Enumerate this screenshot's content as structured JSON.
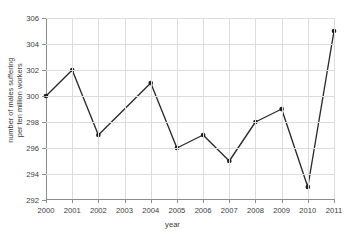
{
  "chart_data": {
    "type": "line",
    "title": "",
    "xlabel": "year",
    "ylabel_lines": [
      "number of males suffering",
      "per ten million workers"
    ],
    "ylabel": "number of males suffering per ten million workers",
    "categories": [
      "2000",
      "2001",
      "2002",
      "2003",
      "2004",
      "2005",
      "2006",
      "2007",
      "2008",
      "2009",
      "2010",
      "2011"
    ],
    "x": [
      2000,
      2001,
      2002,
      2003,
      2004,
      2005,
      2006,
      2007,
      2008,
      2009,
      2010,
      2011
    ],
    "values": [
      300,
      302,
      297,
      null,
      301,
      296,
      297,
      295,
      298,
      299,
      293,
      305
    ],
    "series": [
      {
        "name": "number of males suffering per ten million workers",
        "points": [
          {
            "x": "2000",
            "y": 300,
            "marker": true
          },
          {
            "x": "2001",
            "y": 302,
            "marker": true
          },
          {
            "x": "2002",
            "y": 297,
            "marker": true
          },
          {
            "x": "2003",
            "y": null,
            "marker": false
          },
          {
            "x": "2004",
            "y": 301,
            "marker": true
          },
          {
            "x": "2005",
            "y": 296,
            "marker": true
          },
          {
            "x": "2006",
            "y": 297,
            "marker": true
          },
          {
            "x": "2007",
            "y": 295,
            "marker": true
          },
          {
            "x": "2008",
            "y": 298,
            "marker": true
          },
          {
            "x": "2009",
            "y": 299,
            "marker": true
          },
          {
            "x": "2010",
            "y": 293,
            "marker": true
          },
          {
            "x": "2011",
            "y": 305,
            "marker": true
          }
        ],
        "line_color": "#2b2b2b",
        "marker_color": "#1c1c1c"
      }
    ],
    "ylim": [
      292,
      306
    ],
    "yticks": [
      292,
      294,
      296,
      298,
      300,
      302,
      304,
      306
    ],
    "ytick_labels": [
      "292",
      "294",
      "296",
      "298",
      "300",
      "302",
      "304",
      "306"
    ],
    "xtick_labels": [
      "2000",
      "2001",
      "2002",
      "2003",
      "2004",
      "2005",
      "2006",
      "2007",
      "2008",
      "2009",
      "2010",
      "2011"
    ],
    "xlim": [
      2000,
      2011
    ],
    "grid": true,
    "legend": null,
    "colors": {
      "line": "#2b2b2b",
      "marker": "#1c1c1c",
      "grid": "#dcdcdc",
      "axis": "#8d8d8d",
      "text": "#3b3b3b",
      "background": "#ffffff"
    }
  }
}
